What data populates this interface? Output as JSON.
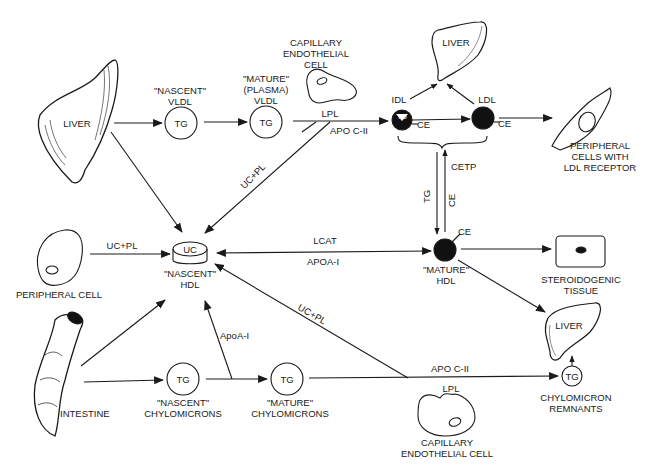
{
  "organs": {
    "liver_main": "LIVER",
    "liver_top": "LIVER",
    "liver_right": "LIVER",
    "intestine": "INTESTINE",
    "peripheral_cell": "PERIPHERAL CELL",
    "peripheral_ldl_cells": [
      "PERIPHERAL",
      "CELLS WITH",
      "LDL RECEPTOR"
    ],
    "capillary_top": [
      "CAPILLARY",
      "ENDOTHELIAL",
      "CELL"
    ],
    "capillary_bottom": [
      "CAPILLARY",
      "ENDOTHELIAL  CELL"
    ],
    "steroidogenic": [
      "STEROIDOGENIC",
      "TISSUE"
    ]
  },
  "particles": {
    "nascent_vldl": {
      "title": [
        "\"NASCENT\"",
        "VLDL"
      ],
      "core": "TG"
    },
    "mature_vldl": {
      "title": [
        "\"MATURE\"",
        "(PLASMA)",
        "VLDL"
      ],
      "core": "TG"
    },
    "idl": {
      "title": "IDL",
      "core": "TG",
      "side": "CE"
    },
    "ldl": {
      "title": "LDL",
      "side": "CE"
    },
    "nascent_hdl": {
      "title": [
        "\"NASCENT\"",
        "HDL"
      ],
      "core": "UC"
    },
    "mature_hdl": {
      "title": [
        "\"MATURE\"",
        "HDL"
      ],
      "side": "CE"
    },
    "nascent_chylo": {
      "title": [
        "\"NASCENT\"",
        "CHYLOMICRONS"
      ],
      "core": "TG"
    },
    "mature_chylo": {
      "title": [
        "\"MATURE\"",
        "CHYLOMICRONS"
      ],
      "core": "TG"
    },
    "chylo_remnants": {
      "title": [
        "CHYLOMICRON",
        "REMNANTS"
      ],
      "core": "TG"
    }
  },
  "edge_labels": {
    "lpl_top": "LPL",
    "apoc2_top": "APO C-II",
    "uc_pl_vldl": "UC+PL",
    "uc_pl_peripheral": "UC+PL",
    "uc_pl_chylo": "UC+PL",
    "cetp": "CETP",
    "tg_down": "TG",
    "ce_up": "CE",
    "lcat": "LCAT",
    "apoa1_hdl": "APOA-I",
    "apoa1_chylo": "ApoA-I",
    "apoc2_bottom": "APO  C-II",
    "lpl_bottom": "LPL"
  },
  "colors": {
    "ink": "#1a1a1a",
    "background": "#ffffff",
    "particle_fill": "#111111"
  }
}
